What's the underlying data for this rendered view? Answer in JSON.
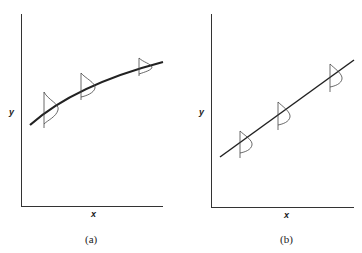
{
  "panels": [
    {
      "id": "a",
      "caption": "(a)",
      "xlabel": "x",
      "ylabel": "y",
      "relationship": "curved (concave increasing)"
    },
    {
      "id": "b",
      "caption": "(b)",
      "xlabel": "x",
      "ylabel": "y",
      "relationship": "linear increasing"
    }
  ],
  "colors": {
    "line": "#222222",
    "background": "#ffffff"
  }
}
